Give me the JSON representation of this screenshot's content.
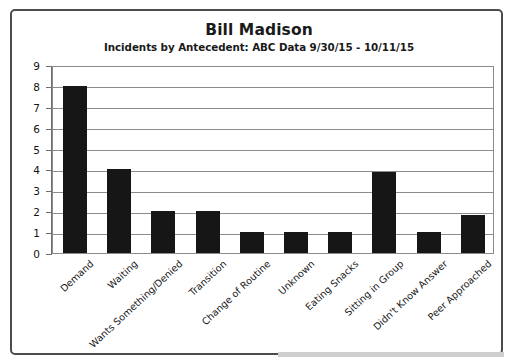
{
  "chart_data": {
    "type": "bar",
    "title": "Bill Madison",
    "subtitle": "Incidents by Antecedent: ABC Data 9/30/15 - 10/11/15",
    "xlabel": "",
    "ylabel": "",
    "ylim": [
      0,
      9
    ],
    "yticks": [
      0,
      1,
      2,
      3,
      4,
      5,
      6,
      7,
      8,
      9
    ],
    "grid": true,
    "legend": false,
    "bar_color": "#161616",
    "categories": [
      "Demand",
      "Waiting",
      "Wants Something/Denied",
      "Transition",
      "Change of Routine",
      "Unknown",
      "Eating Snacks",
      "Sitting in Group",
      "Didn't Know Answer",
      "Peer Approached"
    ],
    "values": [
      8,
      4,
      2,
      2,
      1,
      1,
      1,
      3.9,
      1,
      1.8
    ]
  },
  "frame": {
    "border_color": "#4c4c4c"
  }
}
